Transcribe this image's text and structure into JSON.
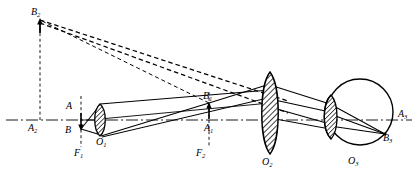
{
  "figure": {
    "type": "optical-ray-diagram",
    "background": "#ffffff",
    "ink": "#000000",
    "width": 418,
    "height": 180
  },
  "labels": {
    "object_top": {
      "text": "A",
      "sub": "",
      "x": 66,
      "y": 106
    },
    "object_bottom": {
      "text": "B",
      "sub": "",
      "x": 65,
      "y": 130
    },
    "lens1_center": {
      "text": "O",
      "sub": "1",
      "x": 96,
      "y": 141
    },
    "focus1": {
      "text": "F",
      "sub": "1",
      "x": 73,
      "y": 151
    },
    "image1_top": {
      "text": "B",
      "sub": "1",
      "x": 203,
      "y": 96
    },
    "image1_bottom": {
      "text": "A",
      "sub": "1",
      "x": 204,
      "y": 127
    },
    "focus2": {
      "text": "F",
      "sub": "2",
      "x": 195,
      "y": 151
    },
    "lens2_center": {
      "text": "O",
      "sub": "2",
      "x": 262,
      "y": 150
    },
    "eye_lens_center": {
      "text": "O",
      "sub": "3",
      "x": 348,
      "y": 153
    },
    "virtual_top": {
      "text": "B",
      "sub": "2",
      "x": 31,
      "y": 12
    },
    "virtual_bottom": {
      "text": "A",
      "sub": "2",
      "x": 29,
      "y": 128
    },
    "retina_axis": {
      "text": "A",
      "sub": "3",
      "x": 398,
      "y": 113
    },
    "retina_image": {
      "text": "B",
      "sub": "3",
      "x": 382,
      "y": 138
    }
  },
  "elements": {
    "optical_axis": {
      "name": "optical-axis",
      "style": "dash-dot",
      "y": 120
    },
    "lens1": {
      "name": "objective-lens",
      "cx": 100,
      "cy": 120,
      "rx": 7,
      "ry": 16,
      "hatched": true
    },
    "lens2": {
      "name": "eyepiece-lens",
      "cx": 270,
      "cy": 113,
      "rx": 12,
      "ry": 41,
      "hatched": true
    },
    "eyeball": {
      "name": "eyeball-outline",
      "cx": 360,
      "cy": 112,
      "r": 33
    },
    "eye_lens": {
      "name": "eye-crystalline-lens",
      "cx": 330,
      "cy": 117,
      "rx": 9,
      "ry": 22,
      "hatched": true
    },
    "object_arrow": {
      "name": "object-arrow",
      "x": 81,
      "y_top": 110,
      "y_bottom": 129
    },
    "image1_arrow": {
      "name": "intermediate-image-arrow",
      "x": 209,
      "y_top": 103,
      "y_bottom": 121
    },
    "virtual_arrow": {
      "name": "virtual-image-arrow",
      "x": 40,
      "y_top": 18,
      "y_bottom": 33
    }
  },
  "line_styles": {
    "ray_solid": "solid",
    "construction_dashed": "dashed",
    "axis_dashdot": "dash-dot"
  }
}
